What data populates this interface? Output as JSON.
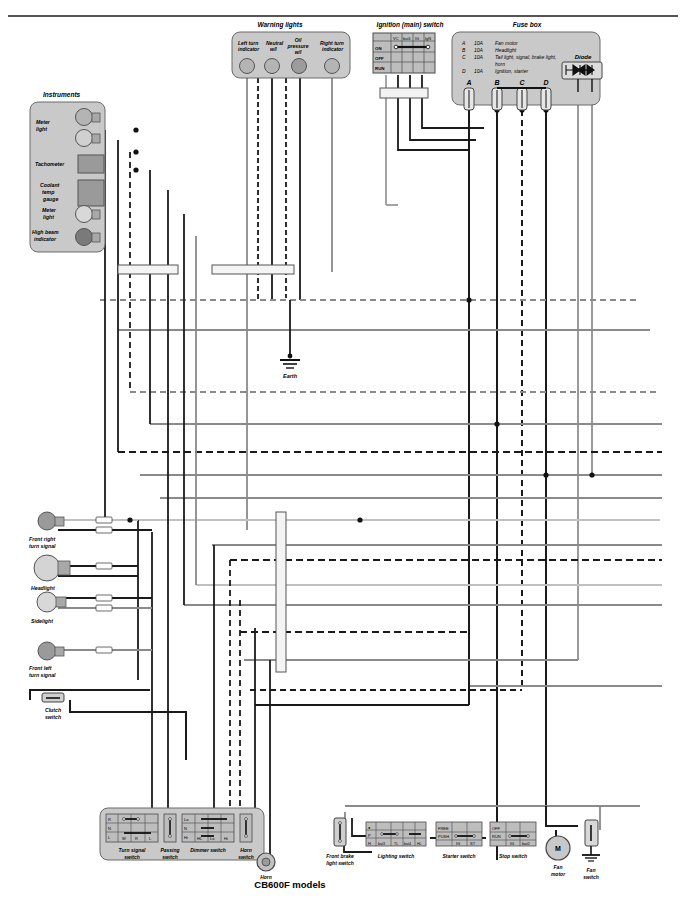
{
  "page": {
    "title": "CB600F models",
    "top_rule": true,
    "background": "#ffffff",
    "panel_fill": "#c9c9c9",
    "panel_stroke": "#6b6b6b",
    "bulb_fill": "#b4b4b4",
    "wire_dark": "#1a1a1a",
    "wire_mid": "#808080",
    "wire_light": "#bdbdbd"
  },
  "groups": {
    "instruments": {
      "label": "Instruments",
      "items": [
        {
          "label": "Meter\nlight",
          "type": "bulb"
        },
        {
          "label": "",
          "type": "bulb"
        },
        {
          "label": "Tachometer",
          "type": "box"
        },
        {
          "label": "Coolant\ntemp\ngauge",
          "type": "box"
        },
        {
          "label": "Meter\nlight",
          "type": "bulb"
        },
        {
          "label": "High beam\nindicator",
          "type": "bulb"
        }
      ]
    },
    "warning_lights": {
      "label": "Warning lights",
      "items": [
        {
          "label": "Left turn\nindicator"
        },
        {
          "label": "Neutral\nw/l"
        },
        {
          "label": "Oil\npressure\nw/l"
        },
        {
          "label": "Right turn\nindicator"
        }
      ]
    },
    "ignition_switch": {
      "label": "Ignition (main) switch",
      "columns": [
        "VC",
        "bat1",
        "IG",
        "IgN"
      ],
      "rows": [
        "ON",
        "OFF",
        "RUN"
      ]
    },
    "fuse_box": {
      "label": "Fuse box",
      "fuses": [
        {
          "id": "A",
          "rating": "10A",
          "circuit": "Fan motor"
        },
        {
          "id": "B",
          "rating": "10A",
          "circuit": "Headlight"
        },
        {
          "id": "C",
          "rating": "10A",
          "circuit": "Tail light, signal, brake light,"
        },
        {
          "id": "C2",
          "rating": "",
          "circuit": "horn"
        },
        {
          "id": "D",
          "rating": "10A",
          "circuit": "Ignition, starter"
        }
      ],
      "terminals": [
        "A",
        "B",
        "C",
        "D"
      ],
      "diode_label": "Diode",
      "diode_count": 3
    },
    "earth": {
      "label": "Earth"
    },
    "front_lamps": [
      {
        "label": "Front right\nturn signal"
      },
      {
        "label": "Headlight"
      },
      {
        "label": "Sidelight"
      },
      {
        "label": "Front left\nturn signal"
      }
    ],
    "clutch_switch": {
      "label": "Clutch\nswitch"
    },
    "handlebar_switches": {
      "turn_signal_switch": {
        "label": "Turn signal\nswitch",
        "rows": [
          "R",
          "N",
          "L"
        ],
        "columns": [
          "W",
          "R",
          "L"
        ]
      },
      "passing_switch": {
        "label": "Passing\nswitch"
      },
      "dimmer_switch": {
        "label": "Dimmer switch",
        "rows": [
          "Lo",
          "N",
          "Hi"
        ],
        "columns": [
          "HL",
          "Lo",
          "Hi"
        ]
      },
      "horn_switch": {
        "label": "Horn\nswitch"
      },
      "horn": {
        "label": "Horn"
      }
    },
    "front_brake_light_switch": {
      "label": "Front brake\nlight switch"
    },
    "lighting_switch": {
      "label": "Lighting switch",
      "rows": [
        "●",
        "P",
        "H"
      ],
      "columns": [
        "bat3",
        "TL",
        "bat4",
        "HL"
      ]
    },
    "starter_switch": {
      "label": "Starter switch",
      "rows": [
        "FREE",
        "PUSH"
      ],
      "columns": [
        "IG",
        "ST"
      ]
    },
    "stop_switch": {
      "label": "Stop switch",
      "rows": [
        "OFF",
        "RUN"
      ],
      "columns": [
        "IG",
        "bat2"
      ]
    },
    "fan_motor": {
      "label": "Fan\nmotor",
      "symbol": "M"
    },
    "fan_switch": {
      "label": "Fan\nswitch"
    }
  }
}
